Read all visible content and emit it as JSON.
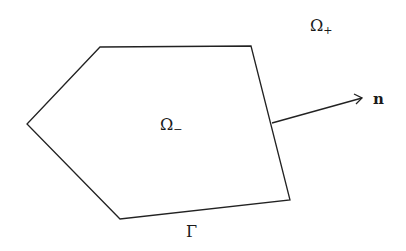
{
  "diagram": {
    "region_outside_label": "Ω",
    "region_outside_sub": "+",
    "region_inside_label": "Ω",
    "region_inside_sub": "−",
    "boundary_label": "Γ",
    "normal_label": "n",
    "polygon_vertices": [
      [
        100,
        47
      ],
      [
        251,
        46
      ],
      [
        290,
        200
      ],
      [
        120,
        219
      ],
      [
        27,
        124
      ]
    ],
    "normal_arrow": {
      "from": [
        272,
        123
      ],
      "to": [
        363,
        98
      ]
    },
    "stroke_color": "#222222"
  }
}
